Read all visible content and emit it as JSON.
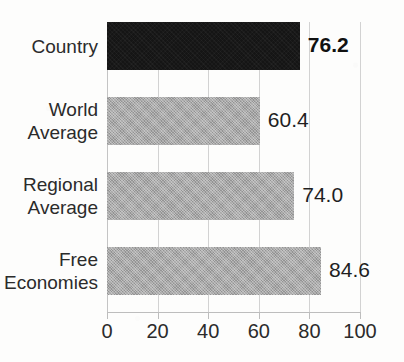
{
  "chart_data": {
    "type": "bar",
    "orientation": "horizontal",
    "title": "",
    "xlabel": "",
    "ylabel": "",
    "xlim": [
      0,
      100
    ],
    "xticks": [
      0,
      20,
      40,
      60,
      80,
      100
    ],
    "xtick_labels": [
      "0",
      "20",
      "40",
      "60",
      "80",
      "100"
    ],
    "grid": true,
    "grid_axis": "x",
    "legend": false,
    "categories": [
      "Country",
      "World Average",
      "Regional Average",
      "Free Economies"
    ],
    "values": [
      76.2,
      60.4,
      74.0,
      84.6
    ],
    "value_labels": [
      "76.2",
      "60.4",
      "74.0",
      "84.6"
    ],
    "bars": [
      {
        "category": "Country",
        "category_lines": [
          "Country"
        ],
        "value": 76.2,
        "value_label": "76.2",
        "color": "#151515",
        "emphasis": true
      },
      {
        "category": "World Average",
        "category_lines": [
          "World",
          "Average"
        ],
        "value": 60.4,
        "value_label": "60.4",
        "color": "#a9a9a9",
        "emphasis": false
      },
      {
        "category": "Regional Average",
        "category_lines": [
          "Regional",
          "Average"
        ],
        "value": 74.0,
        "value_label": "74.0",
        "color": "#a9a9a9",
        "emphasis": false
      },
      {
        "category": "Free Economies",
        "category_lines": [
          "Free",
          "Economies"
        ],
        "value": 84.6,
        "value_label": "84.6",
        "color": "#a9a9a9",
        "emphasis": false
      }
    ],
    "colors": {
      "highlight_bar": "#151515",
      "default_bar": "#a9a9a9",
      "gridline": "#d2d2d2",
      "axis": "#bdbdbd",
      "text": "#2b2b2b",
      "background": "#fdfdfc"
    }
  }
}
